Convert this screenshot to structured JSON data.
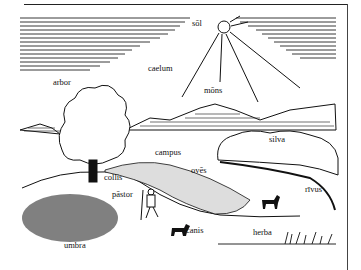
{
  "illustration": {
    "title": "Latin landscape vocabulary",
    "colors": {
      "ink": "#111111",
      "paper": "#ffffff"
    },
    "labels": [
      {
        "key": "sol",
        "text": "sōl",
        "x": 192,
        "y": 23
      },
      {
        "key": "caelum",
        "text": "caelum",
        "x": 148,
        "y": 68
      },
      {
        "key": "arbor",
        "text": "arbor",
        "x": 53,
        "y": 82
      },
      {
        "key": "mons",
        "text": "mōns",
        "x": 204,
        "y": 90
      },
      {
        "key": "silva",
        "text": "silva",
        "x": 269,
        "y": 139
      },
      {
        "key": "campus",
        "text": "campus",
        "x": 155,
        "y": 152
      },
      {
        "key": "oves",
        "text": "ovēs",
        "x": 191,
        "y": 170
      },
      {
        "key": "collis",
        "text": "collis",
        "x": 104,
        "y": 177
      },
      {
        "key": "pastor",
        "text": "pāstor",
        "x": 112,
        "y": 194
      },
      {
        "key": "rivus",
        "text": "rīvus",
        "x": 305,
        "y": 189
      },
      {
        "key": "canis",
        "text": "canis",
        "x": 186,
        "y": 230
      },
      {
        "key": "herba",
        "text": "herba",
        "x": 253,
        "y": 232
      },
      {
        "key": "umbra",
        "text": "umbra",
        "x": 64,
        "y": 245
      }
    ]
  }
}
